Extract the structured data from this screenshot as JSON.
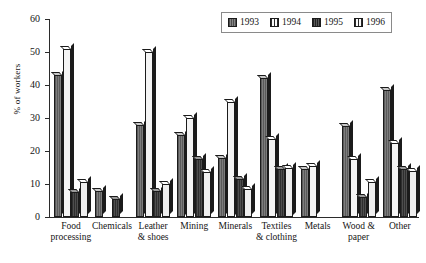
{
  "chart_data": {
    "type": "bar",
    "title": "",
    "xlabel": "",
    "ylabel": "% of workers",
    "ylim": [
      0,
      60
    ],
    "yticks": [
      0,
      10,
      20,
      30,
      40,
      50,
      60
    ],
    "grid": false,
    "legend_position": "top-right",
    "categories": [
      "Food processing",
      "Chemicals",
      "Leather & shoes",
      "Mining",
      "Minerals",
      "Textiles & clothing",
      "Metals",
      "Wood & paper",
      "Other"
    ],
    "category_lines": [
      [
        "Food",
        "processing"
      ],
      [
        "Chemicals",
        ""
      ],
      [
        "Leather",
        "& shoes"
      ],
      [
        "Mining",
        ""
      ],
      [
        "Minerals",
        ""
      ],
      [
        "Textiles",
        "& clothing"
      ],
      [
        "Metals",
        ""
      ],
      [
        "Wood &",
        "paper"
      ],
      [
        "Other",
        ""
      ]
    ],
    "series": [
      {
        "name": "1993",
        "values": [
          43,
          8,
          28,
          25,
          18,
          42,
          14.5,
          27.5,
          38.5
        ]
      },
      {
        "name": "1994",
        "values": [
          51,
          null,
          50,
          30,
          35,
          23.5,
          15.5,
          17.5,
          22.5
        ]
      },
      {
        "name": "1995",
        "values": [
          7.5,
          5.5,
          8,
          17.5,
          11.5,
          14.5,
          null,
          6,
          14.5
        ]
      },
      {
        "name": "1996",
        "values": [
          10.5,
          null,
          10,
          13.5,
          8.5,
          15,
          null,
          10.5,
          14
        ]
      }
    ]
  },
  "legend": {
    "items": [
      {
        "label": "1993",
        "swatch": "series-1993-swatch"
      },
      {
        "label": "1994",
        "swatch": "series-1994-swatch"
      },
      {
        "label": "1995",
        "swatch": "series-1995-swatch"
      },
      {
        "label": "1996",
        "swatch": "series-1996-swatch"
      }
    ]
  },
  "axis": {
    "y_label": "% of workers",
    "y_ticks": [
      "0",
      "10",
      "20",
      "30",
      "40",
      "50",
      "60"
    ]
  }
}
